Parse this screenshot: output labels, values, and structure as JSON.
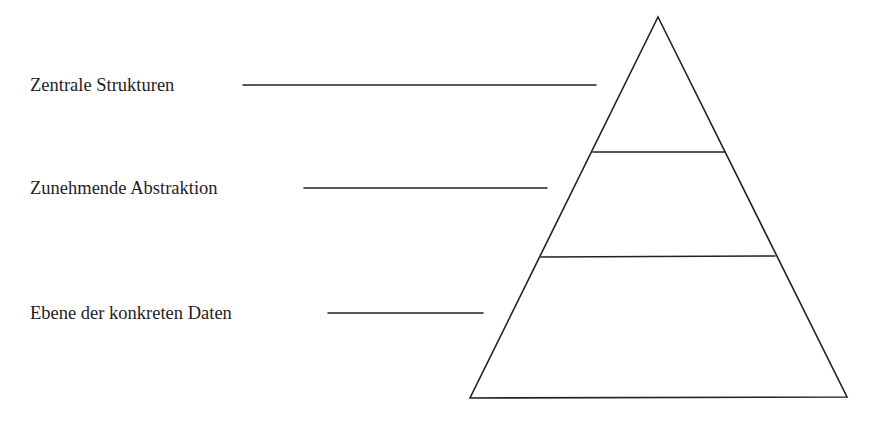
{
  "diagram": {
    "type": "pyramid",
    "levels": [
      {
        "label": "Zentrale Strukturen",
        "position": "top"
      },
      {
        "label": "Zunehmende Abstraktion",
        "position": "middle"
      },
      {
        "label": "Ebene der konkreten Daten",
        "position": "bottom"
      }
    ],
    "line_color": "#222222"
  }
}
